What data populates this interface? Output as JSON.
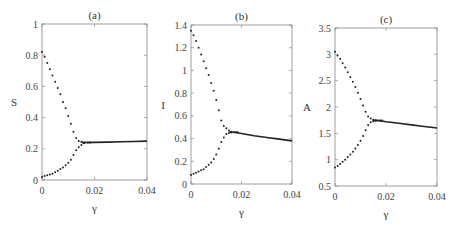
{
  "chart_data": [
    {
      "type": "scatter",
      "title": "(a)",
      "xlabel": "γ",
      "ylabel": "S",
      "xlim": [
        0,
        0.04
      ],
      "ylim": [
        0,
        1
      ],
      "xticks": [
        "0",
        "0.02",
        "0.04"
      ],
      "yticks": [
        "0",
        "0.2",
        "0.4",
        "0.6",
        "0.8",
        "1"
      ],
      "grid": false,
      "series": [
        {
          "name": "upper branch",
          "x": [
            0.0,
            0.001,
            0.002,
            0.003,
            0.004,
            0.005,
            0.006,
            0.007,
            0.008,
            0.009,
            0.01,
            0.011,
            0.012,
            0.013,
            0.014,
            0.015,
            0.016
          ],
          "y": [
            0.82,
            0.79,
            0.75,
            0.71,
            0.67,
            0.63,
            0.59,
            0.55,
            0.5,
            0.46,
            0.41,
            0.36,
            0.31,
            0.27,
            0.25,
            0.245,
            0.24
          ]
        },
        {
          "name": "lower branch",
          "x": [
            0.0,
            0.001,
            0.002,
            0.003,
            0.004,
            0.005,
            0.006,
            0.007,
            0.008,
            0.009,
            0.01,
            0.011,
            0.012,
            0.013,
            0.014,
            0.015,
            0.016
          ],
          "y": [
            0.02,
            0.025,
            0.03,
            0.035,
            0.04,
            0.05,
            0.06,
            0.07,
            0.08,
            0.095,
            0.11,
            0.13,
            0.16,
            0.19,
            0.21,
            0.225,
            0.235
          ]
        },
        {
          "name": "stable line",
          "x": [
            0.017,
            0.02,
            0.025,
            0.03,
            0.035,
            0.04
          ],
          "y": [
            0.24,
            0.241,
            0.243,
            0.245,
            0.247,
            0.249
          ]
        }
      ]
    },
    {
      "type": "scatter",
      "title": "(b)",
      "xlabel": "γ",
      "ylabel": "I",
      "xlim": [
        0,
        0.04
      ],
      "ylim": [
        0,
        1.4
      ],
      "xticks": [
        "0",
        "0.02",
        "0.04"
      ],
      "yticks": [
        "0",
        "0.2",
        "0.4",
        "0.6",
        "0.8",
        "1",
        "1.2",
        "1.4"
      ],
      "grid": false,
      "series": [
        {
          "name": "upper branch",
          "x": [
            0.0,
            0.001,
            0.002,
            0.003,
            0.004,
            0.005,
            0.006,
            0.007,
            0.008,
            0.009,
            0.01,
            0.011,
            0.012,
            0.013,
            0.014,
            0.015,
            0.016
          ],
          "y": [
            1.35,
            1.31,
            1.26,
            1.2,
            1.14,
            1.08,
            1.02,
            0.96,
            0.89,
            0.82,
            0.74,
            0.65,
            0.56,
            0.51,
            0.49,
            0.47,
            0.46
          ]
        },
        {
          "name": "lower branch",
          "x": [
            0.0,
            0.001,
            0.002,
            0.003,
            0.004,
            0.005,
            0.006,
            0.007,
            0.008,
            0.009,
            0.01,
            0.011,
            0.012,
            0.013,
            0.014,
            0.015,
            0.016
          ],
          "y": [
            0.08,
            0.09,
            0.1,
            0.11,
            0.12,
            0.13,
            0.15,
            0.17,
            0.19,
            0.22,
            0.26,
            0.31,
            0.37,
            0.41,
            0.44,
            0.45,
            0.455
          ]
        },
        {
          "name": "stable line",
          "x": [
            0.017,
            0.02,
            0.025,
            0.03,
            0.035,
            0.04
          ],
          "y": [
            0.455,
            0.445,
            0.425,
            0.41,
            0.395,
            0.38
          ]
        }
      ]
    },
    {
      "type": "scatter",
      "title": "(c)",
      "xlabel": "γ",
      "ylabel": "A",
      "xlim": [
        0,
        0.04
      ],
      "ylim": [
        0.5,
        3.5
      ],
      "xticks": [
        "0",
        "0.02",
        "0.04"
      ],
      "yticks": [
        "0.5",
        "1",
        "1.5",
        "2",
        "2.5",
        "3",
        "3.5"
      ],
      "grid": false,
      "series": [
        {
          "name": "upper branch",
          "x": [
            0.0,
            0.001,
            0.002,
            0.003,
            0.004,
            0.005,
            0.006,
            0.007,
            0.008,
            0.009,
            0.01,
            0.011,
            0.012,
            0.013,
            0.014,
            0.015,
            0.016
          ],
          "y": [
            3.05,
            2.98,
            2.91,
            2.83,
            2.75,
            2.66,
            2.57,
            2.48,
            2.38,
            2.27,
            2.15,
            2.03,
            1.91,
            1.82,
            1.78,
            1.76,
            1.75
          ]
        },
        {
          "name": "lower branch",
          "x": [
            0.0,
            0.001,
            0.002,
            0.003,
            0.004,
            0.005,
            0.006,
            0.007,
            0.008,
            0.009,
            0.01,
            0.011,
            0.012,
            0.013,
            0.014,
            0.015,
            0.016
          ],
          "y": [
            0.85,
            0.88,
            0.92,
            0.96,
            1.0,
            1.05,
            1.1,
            1.15,
            1.21,
            1.28,
            1.36,
            1.45,
            1.56,
            1.66,
            1.71,
            1.73,
            1.74
          ]
        },
        {
          "name": "stable line",
          "x": [
            0.017,
            0.02,
            0.025,
            0.03,
            0.035,
            0.04
          ],
          "y": [
            1.745,
            1.72,
            1.69,
            1.66,
            1.63,
            1.6
          ]
        }
      ]
    }
  ],
  "layout": {
    "panels": [
      {
        "left": 42,
        "right": 147,
        "top": 24,
        "bottom": 180
      },
      {
        "left": 191,
        "right": 292,
        "top": 25,
        "bottom": 184
      },
      {
        "left": 335,
        "right": 437,
        "top": 28,
        "bottom": 186
      }
    ],
    "colors": {
      "axis": "#888888",
      "marker": "#222222",
      "line": "#222222"
    }
  }
}
